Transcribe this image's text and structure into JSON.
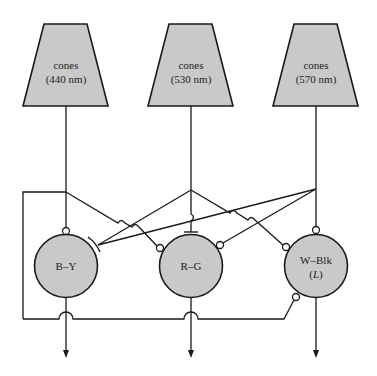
{
  "diagram": {
    "title": "",
    "colors": {
      "fill": "#c9c9c9",
      "stroke": "#1a1a1a",
      "background": "#ffffff"
    },
    "cones": [
      {
        "id": "s",
        "label_line1": "cones",
        "label_line2": "(440 nm)"
      },
      {
        "id": "m",
        "label_line1": "cones",
        "label_line2": "(530 nm)"
      },
      {
        "id": "l",
        "label_line1": "cones",
        "label_line2": "(570 nm)"
      }
    ],
    "opponent_cells": [
      {
        "id": "by",
        "label": "B–Y",
        "label_sub": ""
      },
      {
        "id": "rg",
        "label": "R–G",
        "label_sub": ""
      },
      {
        "id": "wblk",
        "label": "W–Blk",
        "label_sub_open": "(",
        "label_sub_italic": "L",
        "label_sub_close": ")"
      }
    ],
    "legend": {
      "excitatory_synapse": "open circle",
      "inhibitory_synapse": "bar"
    }
  }
}
